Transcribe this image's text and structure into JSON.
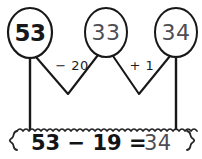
{
  "diagram": {
    "type": "number-jump-strategy",
    "nodes": [
      {
        "id": "start",
        "label": "53",
        "emphasis": "strong",
        "cx": 30,
        "cy": 33,
        "rx": 22,
        "ry": 25
      },
      {
        "id": "middle",
        "label": "33",
        "emphasis": "light",
        "cx": 106,
        "cy": 33,
        "rx": 21,
        "ry": 25
      },
      {
        "id": "end",
        "label": "34",
        "emphasis": "light",
        "cx": 176,
        "cy": 33,
        "rx": 21,
        "ry": 25
      }
    ],
    "jumps": [
      {
        "id": "jump-minus-20",
        "label": "− 20",
        "lx": 72,
        "ly": 66
      },
      {
        "id": "jump-plus-1",
        "label": "+ 1",
        "lx": 142,
        "ly": 66
      }
    ],
    "equation": {
      "strong_part": "53 − 19 =",
      "light_part": "34",
      "full": "53 − 19 = 34"
    },
    "colors": {
      "ink_strong": "#18181a",
      "ink_light": "#4d4d52",
      "background": "#ffffff"
    }
  }
}
